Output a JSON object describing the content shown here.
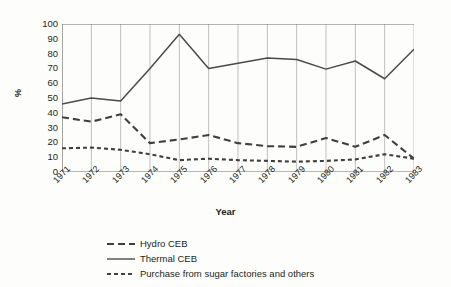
{
  "chart_data": {
    "type": "line",
    "title": "",
    "xlabel": "Year",
    "ylabel": "%",
    "categories": [
      "1971",
      "1972",
      "1973",
      "1974",
      "1975",
      "1976",
      "1977",
      "1978",
      "1979",
      "1980",
      "1981",
      "1982",
      "1983"
    ],
    "x": [
      1971,
      1972,
      1973,
      1974,
      1975,
      1976,
      1977,
      1978,
      1979,
      1980,
      1981,
      1982,
      1983
    ],
    "series": [
      {
        "name": "Hydro CEB",
        "style": "dashed",
        "color": "#3f3f3f",
        "values": [
          37,
          34,
          39,
          19.5,
          22,
          25,
          19.5,
          17.5,
          17,
          23,
          17,
          25,
          9
        ]
      },
      {
        "name": "Thermal CEB",
        "style": "solid",
        "color": "#4a4a4a",
        "values": [
          46,
          50,
          48,
          70,
          93,
          70,
          73.5,
          77,
          76,
          69.5,
          75,
          63,
          83
        ]
      },
      {
        "name": "Purchase from sugar factories and others",
        "style": "dotted",
        "color": "#3f3f3f",
        "values": [
          16,
          16.5,
          15,
          12,
          8,
          9,
          8,
          7.5,
          7,
          7.5,
          8.5,
          12,
          9
        ]
      }
    ],
    "ylim": [
      0,
      100
    ],
    "ytick_step": 10,
    "ytick_labels": [
      "100",
      "90",
      "80",
      "70",
      "60",
      "50",
      "40",
      "30",
      "20",
      "10",
      "0"
    ],
    "grid": "vertical",
    "grid_color": "#b8b8b8",
    "axis_color": "#6f6f6f",
    "legend_position": "bottom"
  }
}
